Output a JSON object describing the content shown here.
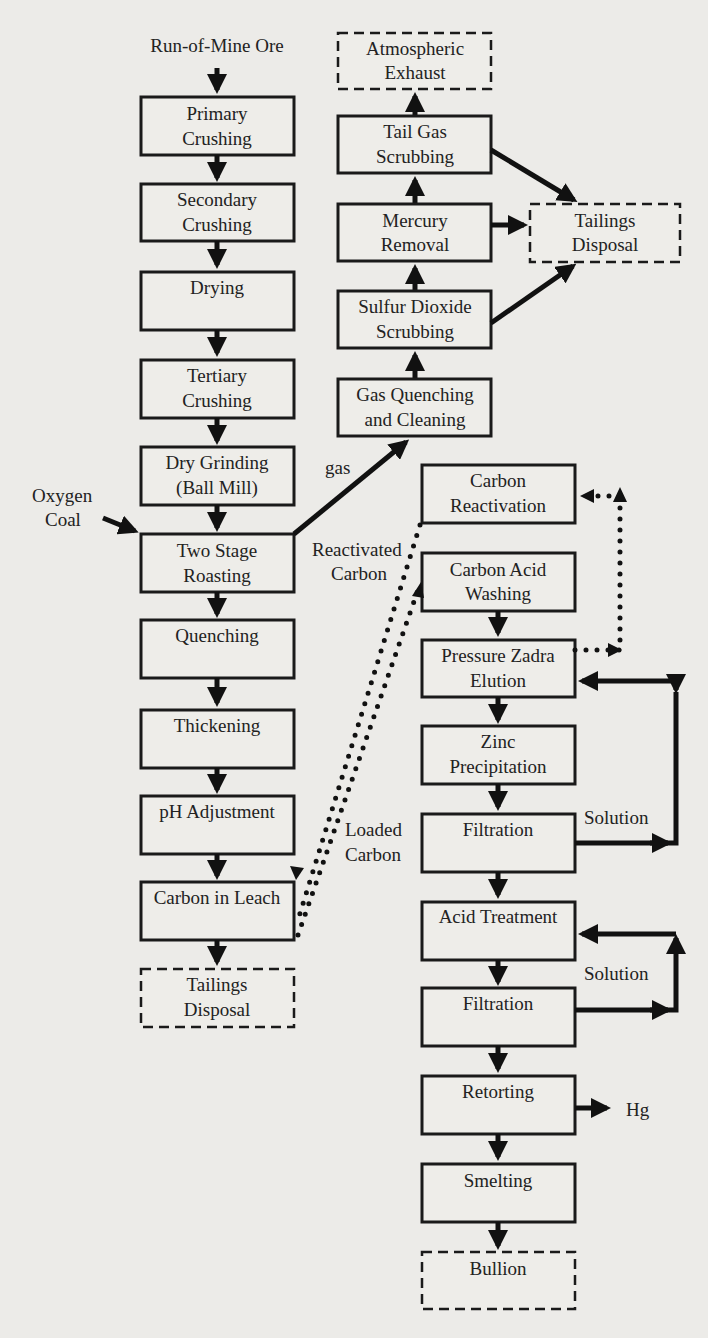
{
  "diagram": {
    "colors": {
      "background": "#ecebe8",
      "box_fill": "#eeede9",
      "stroke": "#1a1a1a",
      "text": "#222222"
    },
    "inputs": {
      "run_of_mine": "Run-of-Mine Ore",
      "oxygen": "Oxygen",
      "coal": "Coal"
    },
    "left_column": [
      {
        "id": "primary",
        "line1": "Primary",
        "line2": "Crushing"
      },
      {
        "id": "secondary",
        "line1": "Secondary",
        "line2": "Crushing"
      },
      {
        "id": "drying",
        "line1": "Drying",
        "line2": ""
      },
      {
        "id": "tertiary",
        "line1": "Tertiary",
        "line2": "Crushing"
      },
      {
        "id": "dry_grinding",
        "line1": "Dry Grinding",
        "line2": "(Ball Mill)"
      },
      {
        "id": "roasting",
        "line1": "Two Stage",
        "line2": "Roasting"
      },
      {
        "id": "quenching",
        "line1": "Quenching",
        "line2": ""
      },
      {
        "id": "thickening",
        "line1": "Thickening",
        "line2": ""
      },
      {
        "id": "ph",
        "line1": "pH Adjustment",
        "line2": ""
      },
      {
        "id": "cil",
        "line1": "Carbon in Leach",
        "line2": ""
      },
      {
        "id": "tailings_left",
        "line1": "Tailings",
        "line2": "Disposal",
        "terminal": true
      }
    ],
    "gas_column": [
      {
        "id": "atmos",
        "line1": "Atmospheric",
        "line2": "Exhaust",
        "terminal": true
      },
      {
        "id": "tail_gas",
        "line1": "Tail Gas",
        "line2": "Scrubbing"
      },
      {
        "id": "mercury",
        "line1": "Mercury",
        "line2": "Removal"
      },
      {
        "id": "so2",
        "line1": "Sulfur Dioxide",
        "line2": "Scrubbing"
      },
      {
        "id": "gas_quench",
        "line1": "Gas Quenching",
        "line2": "and Cleaning"
      }
    ],
    "tailings_right": {
      "line1": "Tailings",
      "line2": "Disposal",
      "terminal": true
    },
    "carbon_column": [
      {
        "id": "reactivation",
        "line1": "Carbon",
        "line2": "Reactivation"
      },
      {
        "id": "acid_wash",
        "line1": "Carbon Acid",
        "line2": "Washing"
      },
      {
        "id": "zadra",
        "line1": "Pressure Zadra",
        "line2": "Elution"
      },
      {
        "id": "zinc",
        "line1": "Zinc",
        "line2": "Precipitation"
      },
      {
        "id": "filtration1",
        "line1": "Filtration",
        "line2": ""
      },
      {
        "id": "acid_treat",
        "line1": "Acid Treatment",
        "line2": ""
      },
      {
        "id": "filtration2",
        "line1": "Filtration",
        "line2": ""
      },
      {
        "id": "retorting",
        "line1": "Retorting",
        "line2": ""
      },
      {
        "id": "smelting",
        "line1": "Smelting",
        "line2": ""
      },
      {
        "id": "bullion",
        "line1": "Bullion",
        "line2": "",
        "terminal": true
      }
    ],
    "edge_labels": {
      "gas": "gas",
      "reactivated_1": "Reactivated",
      "reactivated_2": "Carbon",
      "loaded_1": "Loaded",
      "loaded_2": "Carbon",
      "solution_1": "Solution",
      "solution_2": "Solution",
      "hg": "Hg"
    }
  }
}
